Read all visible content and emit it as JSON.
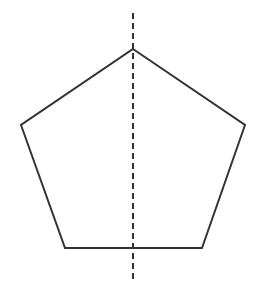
{
  "figure": {
    "type": "geometry-diagram",
    "background": "#ffffff",
    "stroke_color": "#333333",
    "pentagon": {
      "vertices": [
        {
          "name": "apex",
          "x": 133,
          "y": 49
        },
        {
          "name": "right",
          "x": 245,
          "y": 125
        },
        {
          "name": "bottom-right",
          "x": 202,
          "y": 248
        },
        {
          "name": "bottom-left",
          "x": 65,
          "y": 248
        },
        {
          "name": "left",
          "x": 21,
          "y": 125
        }
      ],
      "points_attr": "133,49 245,125 202,248 65,248 21,125"
    },
    "symmetry_line": {
      "style": "dashed",
      "x1": "133",
      "y1": "13",
      "x2": "133",
      "y2": "281"
    }
  }
}
